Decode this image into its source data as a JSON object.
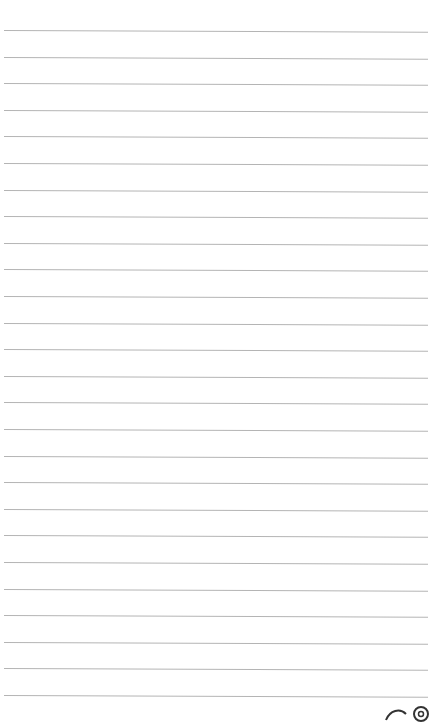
{
  "page": {
    "type": "lined-notepaper",
    "line_color": "#b4b4b4",
    "background": "#ffffff",
    "line_count": 26,
    "first_line_y": 30,
    "line_spacing": 26.6
  },
  "footer": {
    "logo": "brand-logo-icon"
  }
}
